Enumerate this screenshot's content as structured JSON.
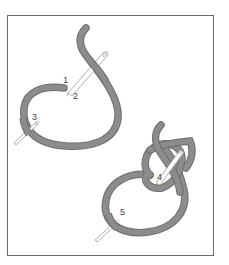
{
  "figure": {
    "type": "embroidery stitch instruction diagram",
    "colors": {
      "thread": "#8c8c8c",
      "thread_edge": "#6e6e6e",
      "needle": "#ffffff",
      "needle_outline": "#9a9a9a",
      "frame": "#6a6a6a",
      "label": "#444444"
    },
    "labels": [
      {
        "id": "1",
        "text": "1"
      },
      {
        "id": "2",
        "text": "2"
      },
      {
        "id": "3",
        "text": "3"
      },
      {
        "id": "4",
        "text": "4"
      },
      {
        "id": "5",
        "text": "5"
      }
    ]
  }
}
